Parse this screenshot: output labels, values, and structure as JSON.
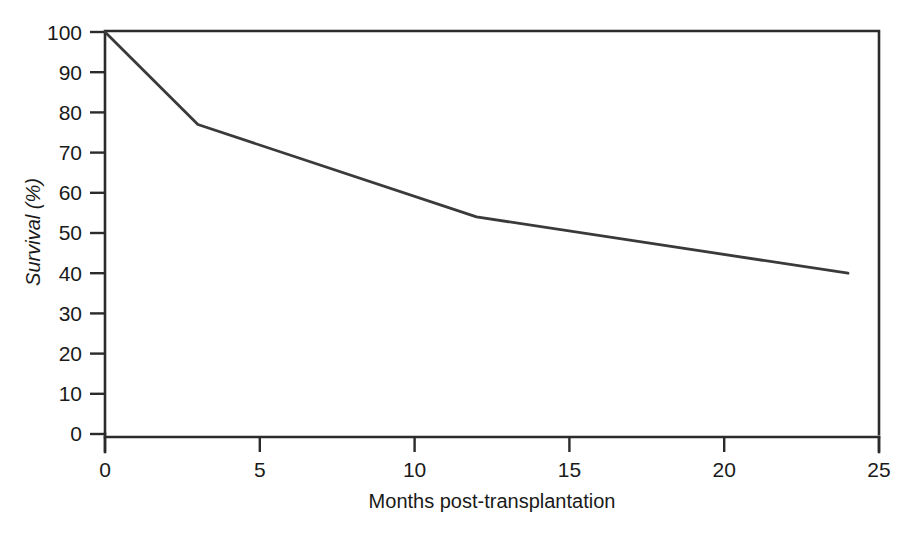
{
  "chart_data": {
    "type": "line",
    "title": "",
    "xlabel": "Months post-transplantation",
    "ylabel": "Survival (%)",
    "xlim": [
      0,
      25
    ],
    "ylim": [
      0,
      100
    ],
    "grid": false,
    "legend": null,
    "x": [
      0,
      3,
      12,
      24
    ],
    "values": [
      100,
      77,
      54,
      40
    ],
    "series": [
      {
        "name": "Survival",
        "color": "#3a3a3a",
        "x": [
          0,
          3,
          12,
          24
        ],
        "values": [
          100,
          77,
          54,
          40
        ]
      }
    ],
    "xticks": [
      0,
      5,
      10,
      15,
      20,
      25
    ],
    "xtick_labels": [
      "0",
      "5",
      "10",
      "15",
      "20",
      "25"
    ],
    "yticks": [
      0,
      10,
      20,
      30,
      40,
      50,
      60,
      70,
      80,
      90,
      100
    ],
    "ytick_labels": [
      "0",
      "10",
      "20",
      "30",
      "40",
      "50",
      "60",
      "70",
      "80",
      "90",
      "100"
    ]
  },
  "axes": {
    "y_title": "Survival (%)",
    "x_title": "Months post-transplantation"
  },
  "ytick_labels": {
    "t0": "0",
    "t1": "10",
    "t2": "20",
    "t3": "30",
    "t4": "40",
    "t5": "50",
    "t6": "60",
    "t7": "70",
    "t8": "80",
    "t9": "90",
    "t10": "100"
  },
  "xtick_labels": {
    "t0": "0",
    "t1": "5",
    "t2": "10",
    "t3": "15",
    "t4": "20",
    "t5": "25"
  },
  "colors": {
    "line": "#3a3a3a",
    "frame": "#2b2b2b",
    "background": "#ffffff",
    "text": "#1a1a1a"
  }
}
